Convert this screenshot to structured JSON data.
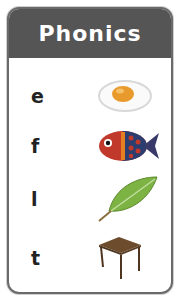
{
  "card": {
    "title": "Phonics",
    "header_color": "#555555",
    "items": [
      {
        "letter": "e",
        "picture": "egg"
      },
      {
        "letter": "f",
        "picture": "fish"
      },
      {
        "letter": "l",
        "picture": "leaf"
      },
      {
        "letter": "t",
        "picture": "table"
      }
    ]
  }
}
